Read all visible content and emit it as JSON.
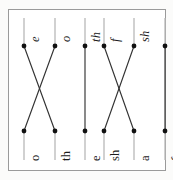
{
  "page": {
    "orientation": "rotated-90",
    "background_color": "#fbfbfa",
    "frame_color": "#9a9a9a",
    "line_color": "#333333",
    "stem_color": "#b9b9b9",
    "node_color": "#111111"
  },
  "groups": [
    {
      "id": "group-left",
      "top_row": [
        {
          "id": "L-top-1",
          "label": "e",
          "x": 24,
          "y": 46
        },
        {
          "id": "L-top-2",
          "label": "o",
          "x": 55,
          "y": 46
        },
        {
          "id": "L-top-3",
          "label": "th",
          "x": 85,
          "y": 46
        }
      ],
      "bottom_row": [
        {
          "id": "L-bot-1",
          "label": "o",
          "x": 24,
          "y": 131
        },
        {
          "id": "L-bot-2",
          "label": "th",
          "x": 55,
          "y": 131
        },
        {
          "id": "L-bot-3",
          "label": "e",
          "x": 85,
          "y": 131
        }
      ],
      "connections": [
        {
          "id": "L-conn-1",
          "from": "L-top-1",
          "to": "L-bot-2",
          "from_label": "e",
          "to_label": "th"
        },
        {
          "id": "L-conn-2",
          "from": "L-top-2",
          "to": "L-bot-1",
          "from_label": "o",
          "to_label": "o"
        },
        {
          "id": "L-conn-3",
          "from": "L-top-3",
          "to": "L-bot-3",
          "from_label": "th",
          "to_label": "e"
        }
      ]
    },
    {
      "id": "group-right",
      "top_row": [
        {
          "id": "R-top-1",
          "label": "f",
          "x": 104,
          "y": 46
        },
        {
          "id": "R-top-2",
          "label": "sh",
          "x": 134,
          "y": 46
        },
        {
          "id": "R-top-3",
          "label": "a",
          "x": 165,
          "y": 46
        }
      ],
      "bottom_row": [
        {
          "id": "R-bot-1",
          "label": "sh",
          "x": 104,
          "y": 131
        },
        {
          "id": "R-bot-2",
          "label": "a",
          "x": 134,
          "y": 131
        },
        {
          "id": "R-bot-3",
          "label": "f",
          "x": 165,
          "y": 131
        }
      ],
      "connections": [
        {
          "id": "R-conn-1",
          "from": "R-top-1",
          "to": "R-bot-2",
          "from_label": "f",
          "to_label": "a"
        },
        {
          "id": "R-conn-2",
          "from": "R-top-2",
          "to": "R-bot-1",
          "from_label": "sh",
          "to_label": "sh"
        },
        {
          "id": "R-conn-3",
          "from": "R-top-3",
          "to": "R-bot-3",
          "from_label": "a",
          "to_label": "f"
        }
      ]
    }
  ],
  "geometry": {
    "node_radius": 2.4,
    "top_node_y": 46,
    "bottom_node_y": 131,
    "top_stem_from_y": 18,
    "bottom_stem_to_y": 160,
    "top_label_offset": 4,
    "bottom_label_offset": 6
  }
}
